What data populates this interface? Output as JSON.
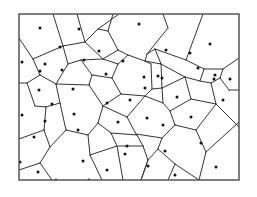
{
  "diagram": {
    "type": "voronoi",
    "frame": {
      "x": 19,
      "y": 14,
      "width": 220,
      "height": 166
    },
    "colors": {
      "background": "#ffffff",
      "edge": "#333333",
      "frame": "#555555",
      "site": "#111111"
    },
    "edges": [
      [
        19,
        38,
        33,
        59
      ],
      [
        33,
        59,
        40,
        75
      ],
      [
        33,
        59,
        63,
        46
      ],
      [
        63,
        46,
        53,
        14
      ],
      [
        63,
        46,
        85,
        42
      ],
      [
        85,
        42,
        77,
        14
      ],
      [
        85,
        42,
        98,
        29
      ],
      [
        98,
        29,
        119,
        14
      ],
      [
        98,
        29,
        108,
        31
      ],
      [
        108,
        31,
        113,
        14
      ],
      [
        108,
        31,
        118,
        50
      ],
      [
        118,
        50,
        103,
        59
      ],
      [
        103,
        59,
        85,
        42
      ],
      [
        118,
        50,
        128,
        55
      ],
      [
        40,
        75,
        27,
        83
      ],
      [
        27,
        83,
        19,
        83
      ],
      [
        40,
        75,
        56,
        84
      ],
      [
        56,
        84,
        68,
        64
      ],
      [
        68,
        64,
        63,
        46
      ],
      [
        68,
        64,
        81,
        60
      ],
      [
        81,
        60,
        103,
        59
      ],
      [
        81,
        60,
        92,
        75
      ],
      [
        92,
        75,
        89,
        85
      ],
      [
        89,
        85,
        56,
        84
      ],
      [
        56,
        84,
        60,
        103
      ],
      [
        60,
        103,
        46,
        107
      ],
      [
        46,
        107,
        35,
        106
      ],
      [
        35,
        106,
        27,
        83
      ],
      [
        92,
        75,
        112,
        78
      ],
      [
        112,
        78,
        118,
        64
      ],
      [
        118,
        64,
        103,
        59
      ],
      [
        118,
        64,
        128,
        55
      ],
      [
        128,
        55,
        145,
        61
      ],
      [
        145,
        61,
        147,
        54
      ],
      [
        147,
        54,
        168,
        28
      ],
      [
        168,
        28,
        163,
        14
      ],
      [
        147,
        54,
        155,
        49
      ],
      [
        155,
        49,
        161,
        64
      ],
      [
        161,
        64,
        145,
        61
      ],
      [
        155,
        49,
        186,
        60
      ],
      [
        186,
        60,
        203,
        14
      ],
      [
        186,
        60,
        204,
        69
      ],
      [
        204,
        69,
        200,
        81
      ],
      [
        200,
        81,
        185,
        77
      ],
      [
        185,
        77,
        161,
        64
      ],
      [
        204,
        69,
        223,
        69
      ],
      [
        223,
        69,
        239,
        58
      ],
      [
        223,
        69,
        220,
        78
      ],
      [
        220,
        78,
        229,
        90
      ],
      [
        220,
        78,
        211,
        83
      ],
      [
        211,
        83,
        200,
        81
      ],
      [
        229,
        90,
        239,
        90
      ],
      [
        211,
        83,
        216,
        104
      ],
      [
        216,
        104,
        191,
        99
      ],
      [
        191,
        99,
        185,
        77
      ],
      [
        216,
        104,
        239,
        127
      ],
      [
        112,
        78,
        121,
        94
      ],
      [
        121,
        94,
        103,
        106
      ],
      [
        103,
        106,
        89,
        85
      ],
      [
        121,
        94,
        145,
        96
      ],
      [
        145,
        96,
        152,
        89
      ],
      [
        152,
        89,
        151,
        64
      ],
      [
        151,
        64,
        145,
        61
      ],
      [
        152,
        89,
        162,
        88
      ],
      [
        162,
        88,
        161,
        64
      ],
      [
        162,
        88,
        185,
        77
      ],
      [
        162,
        88,
        163,
        103
      ],
      [
        163,
        103,
        145,
        96
      ],
      [
        163,
        103,
        170,
        111
      ],
      [
        170,
        111,
        191,
        99
      ],
      [
        170,
        111,
        175,
        125
      ],
      [
        175,
        125,
        196,
        130
      ],
      [
        196,
        130,
        216,
        104
      ],
      [
        196,
        130,
        206,
        152
      ],
      [
        206,
        152,
        199,
        180
      ],
      [
        206,
        152,
        239,
        122
      ],
      [
        175,
        125,
        162,
        138
      ],
      [
        162,
        138,
        136,
        134
      ],
      [
        136,
        134,
        127,
        117
      ],
      [
        127,
        117,
        145,
        96
      ],
      [
        127,
        117,
        103,
        106
      ],
      [
        103,
        106,
        98,
        123
      ],
      [
        98,
        123,
        88,
        135
      ],
      [
        88,
        135,
        66,
        130
      ],
      [
        66,
        130,
        60,
        103
      ],
      [
        46,
        107,
        44,
        130
      ],
      [
        44,
        130,
        19,
        139
      ],
      [
        44,
        130,
        50,
        147
      ],
      [
        50,
        147,
        66,
        130
      ],
      [
        50,
        147,
        40,
        163
      ],
      [
        40,
        163,
        19,
        170
      ],
      [
        40,
        163,
        52,
        180
      ],
      [
        98,
        123,
        111,
        133
      ],
      [
        111,
        133,
        137,
        135
      ],
      [
        137,
        135,
        136,
        134
      ],
      [
        111,
        133,
        117,
        146
      ],
      [
        117,
        146,
        90,
        155
      ],
      [
        90,
        155,
        88,
        135
      ],
      [
        90,
        155,
        102,
        180
      ],
      [
        117,
        146,
        123,
        180
      ],
      [
        137,
        135,
        143,
        146
      ],
      [
        143,
        146,
        118,
        146
      ],
      [
        143,
        146,
        148,
        160
      ],
      [
        148,
        160,
        141,
        180
      ],
      [
        148,
        160,
        158,
        149
      ],
      [
        158,
        149,
        162,
        138
      ],
      [
        158,
        149,
        175,
        164
      ],
      [
        175,
        164,
        168,
        180
      ],
      [
        175,
        164,
        199,
        180
      ],
      [
        148,
        160,
        141,
        180
      ]
    ],
    "sites": [
      [
        40,
        28
      ],
      [
        79,
        29
      ],
      [
        139,
        24
      ],
      [
        210,
        44
      ],
      [
        60,
        47
      ],
      [
        45,
        64
      ],
      [
        99,
        51
      ],
      [
        166,
        50
      ],
      [
        190,
        53
      ],
      [
        40,
        71
      ],
      [
        62,
        70
      ],
      [
        84,
        60
      ],
      [
        123,
        61
      ],
      [
        144,
        77
      ],
      [
        158,
        76
      ],
      [
        162,
        78
      ],
      [
        198,
        68
      ],
      [
        215,
        75
      ],
      [
        214,
        79
      ],
      [
        230,
        79
      ],
      [
        22,
        62
      ],
      [
        39,
        90
      ],
      [
        73,
        89
      ],
      [
        106,
        74
      ],
      [
        145,
        88
      ],
      [
        177,
        97
      ],
      [
        223,
        100
      ],
      [
        52,
        104
      ],
      [
        107,
        103
      ],
      [
        130,
        100
      ],
      [
        45,
        121
      ],
      [
        74,
        114
      ],
      [
        147,
        118
      ],
      [
        191,
        117
      ],
      [
        201,
        143
      ],
      [
        34,
        137
      ],
      [
        78,
        130
      ],
      [
        118,
        122
      ],
      [
        163,
        125
      ],
      [
        127,
        146
      ],
      [
        165,
        151
      ],
      [
        83,
        161
      ],
      [
        125,
        154
      ],
      [
        216,
        167
      ],
      [
        107,
        170
      ],
      [
        148,
        166
      ],
      [
        175,
        175
      ],
      [
        38,
        172
      ],
      [
        56,
        180
      ],
      [
        89,
        180
      ],
      [
        20,
        162
      ],
      [
        22,
        115
      ]
    ]
  }
}
